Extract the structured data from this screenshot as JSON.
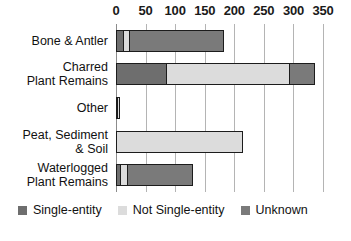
{
  "chart_data": {
    "type": "bar",
    "orientation": "horizontal",
    "stacked": true,
    "title": "",
    "xlabel": "",
    "ylabel": "",
    "xlim": [
      0,
      350
    ],
    "x_ticks": [
      0,
      50,
      100,
      150,
      200,
      250,
      300,
      350
    ],
    "grid": true,
    "legend_position": "bottom",
    "categories": [
      "Bone & Antler",
      "Charred\nPlant Remains",
      "Other",
      "Peat, Sediment\n& Soil",
      "Waterlogged\nPlant Remains"
    ],
    "series": [
      {
        "name": "Single-entity",
        "color": "#6e6e6e",
        "values": [
          11,
          84,
          3,
          0,
          5
        ]
      },
      {
        "name": "Not Single-entity",
        "color": "#dcdcdc",
        "values": [
          8,
          211,
          4,
          215,
          11
        ]
      },
      {
        "name": "Unknown",
        "color": "#7a7a7a",
        "values": [
          164,
          42,
          0,
          0,
          115
        ]
      }
    ],
    "totals": [
      183,
      337,
      7,
      215,
      131
    ]
  },
  "legend": {
    "items": [
      {
        "label": "Single-entity",
        "color": "#6e6e6e"
      },
      {
        "label": "Not Single-entity",
        "color": "#dcdcdc"
      },
      {
        "label": "Unknown",
        "color": "#7a7a7a"
      }
    ]
  },
  "colors": {
    "gridline": "#b4b4b4",
    "bar_outline": "#1c1c1c",
    "background": "#ffffff",
    "text": "#111111"
  }
}
